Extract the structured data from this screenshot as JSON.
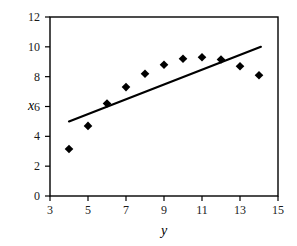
{
  "chart_data": {
    "type": "scatter",
    "title": "",
    "xlabel": "y",
    "ylabel": "x",
    "xlim": [
      3,
      15
    ],
    "ylim": [
      0,
      12
    ],
    "xticks": [
      3,
      5,
      7,
      9,
      11,
      13,
      15
    ],
    "yticks": [
      0,
      2,
      4,
      6,
      8,
      10,
      12
    ],
    "xtick_labels": [
      "3",
      "5",
      "7",
      "9",
      "11",
      "13",
      "15"
    ],
    "ytick_labels": [
      "0",
      "2",
      "4",
      "6",
      "8",
      "10",
      "12"
    ],
    "grid": false,
    "legend": null,
    "marker": "diamond",
    "marker_color": "#000000",
    "series": [
      {
        "name": "data",
        "type": "scatter",
        "x": [
          4,
          5,
          6,
          7,
          8,
          9,
          10,
          11,
          12,
          13,
          14
        ],
        "y": [
          3.15,
          4.7,
          6.2,
          7.3,
          8.2,
          8.8,
          9.2,
          9.3,
          9.15,
          8.7,
          8.1
        ]
      },
      {
        "name": "trend-line",
        "type": "line",
        "line_color": "#000000",
        "x": [
          4.0,
          14.1
        ],
        "y": [
          5.0,
          10.0
        ]
      }
    ]
  },
  "axes": {
    "x_title": "y",
    "y_title": "x"
  }
}
